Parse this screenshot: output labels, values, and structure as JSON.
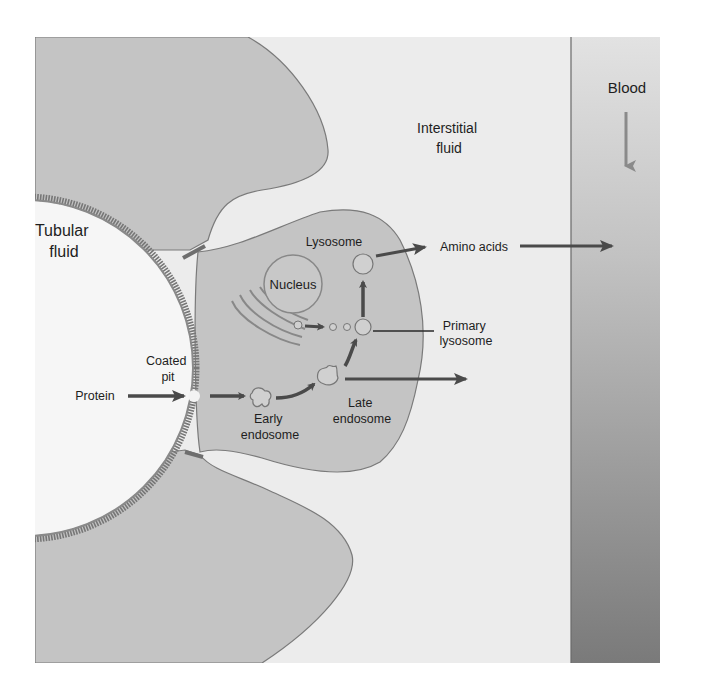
{
  "regions": {
    "tubular_fluid": [
      "Tubular",
      "fluid"
    ],
    "interstitial_fluid": [
      "Interstitial",
      "fluid"
    ],
    "blood": "Blood"
  },
  "labels": {
    "lysosome": "Lysosome",
    "nucleus": "Nucleus",
    "amino_acids": "Amino acids",
    "primary_lysosome": [
      "Primary",
      "lysosome"
    ],
    "coated_pit": [
      "Coated",
      "pit"
    ],
    "protein": "Protein",
    "early_endosome": [
      "Early",
      "endosome"
    ],
    "late_endosome": [
      "Late",
      "endosome"
    ]
  },
  "colors": {
    "background": "#ffffff",
    "interstitial": "#ececec",
    "cell": "#c4c4c4",
    "cell_outline": "#7a7a7a",
    "brush_border": "#777777",
    "tubular": "#f6f6f6",
    "arrow": "#4a4a4a",
    "blood_top": "#e0e0e0",
    "blood_bottom": "#7c7c7c",
    "text": "#1e1e1e"
  }
}
